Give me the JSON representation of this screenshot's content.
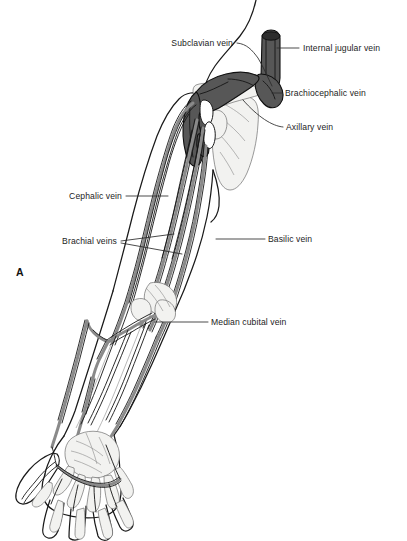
{
  "figure": {
    "panel_letter": "A",
    "title_text": "",
    "background_color": "#ffffff",
    "ink_color": "#1a1a1a",
    "vein_fill_superficial": "#8a8a8a",
    "vein_fill_deep": "#575757",
    "bone_fill": "#f2f2f0",
    "label_color": "#1c1c1c"
  },
  "labels": [
    {
      "id": "subclavian-vein",
      "text": "Subclavian vein",
      "text_x": 233,
      "text_y": 46,
      "anchor": "end",
      "leader": "M 237 43 C 247 44 252 50 258 58 C 264 68 268 78 272 86"
    },
    {
      "id": "internal-jugular-vein",
      "text": "Internal jugular vein",
      "text_x": 303,
      "text_y": 51,
      "anchor": "start",
      "leader": "M 299 48 L 277 48"
    },
    {
      "id": "brachiocephalic-vein",
      "text": "Brachiocephalic vein",
      "text_x": 285,
      "text_y": 96,
      "anchor": "start",
      "leader": "M 282 93 L 272 93"
    },
    {
      "id": "axillary-vein",
      "text": "Axillary vein",
      "text_x": 286,
      "text_y": 130,
      "anchor": "start",
      "leader": "M 283 127 C 272 126 258 117 243 100"
    },
    {
      "id": "cephalic-vein",
      "text": "Cephalic vein",
      "text_x": 122,
      "text_y": 199,
      "anchor": "end",
      "leader": "M 126 196 L 168 196"
    },
    {
      "id": "brachial-veins",
      "text": "Brachial veins",
      "text_x": 117,
      "text_y": 244,
      "anchor": "end",
      "leader": "M 121 241 L 174 234 M 121 243 L 182 254"
    },
    {
      "id": "basilic-vein",
      "text": "Basilic vein",
      "text_x": 268,
      "text_y": 242,
      "anchor": "start",
      "leader": "M 265 239 L 216 239"
    },
    {
      "id": "median-cubital-vein",
      "text": "Median cubital vein",
      "text_x": 211,
      "text_y": 325,
      "anchor": "start",
      "leader": "M 208 322 L 155 322"
    }
  ]
}
